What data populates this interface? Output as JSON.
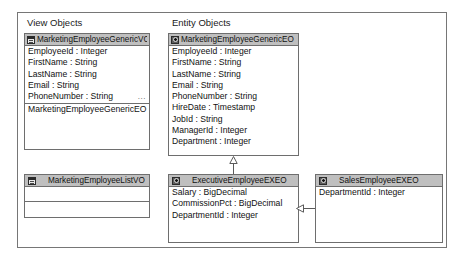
{
  "diagram": {
    "groups": [
      {
        "id": "view-objects",
        "label": "View Objects"
      },
      {
        "id": "entity-objects",
        "label": "Entity Objects"
      }
    ],
    "classes": [
      {
        "id": "marketing-employee-generic-vo",
        "name": "MarketingEmployeeGenericVO",
        "icon": "view-object-icon",
        "attributes": [
          "EmployeeId : Integer",
          "FirstName : String",
          "LastName : String",
          "Email : String",
          "PhoneNumber : String"
        ],
        "overflow_marker": "...",
        "nested": [
          "MarketingEmployeeGenericEO"
        ]
      },
      {
        "id": "marketing-employee-generic-eo",
        "name": "MarketingEmployeeGenericEO",
        "icon": "entity-object-icon",
        "attributes": [
          "EmployeeId : Integer",
          "FirstName : String",
          "LastName : String",
          "Email : String",
          "PhoneNumber : String",
          "HireDate : Timestamp",
          "JobId : String",
          "ManagerId : Integer",
          "Department : Integer"
        ]
      },
      {
        "id": "marketing-employee-list-vo",
        "name": "MarketingEmployeeListVO",
        "icon": "view-object-icon",
        "attributes": []
      },
      {
        "id": "executive-employee-exeo",
        "name": "ExecutiveEmployeeEXEO",
        "icon": "entity-object-icon",
        "attributes": [
          "Salary : BigDecimal",
          "CommissionPct : BigDecimal",
          "DepartmentId : Integer"
        ]
      },
      {
        "id": "sales-employee-exeo",
        "name": "SalesEmployeeEXEO",
        "icon": "entity-object-icon",
        "attributes": [
          "DepartmentId : Integer"
        ]
      }
    ],
    "relationships": [
      {
        "id": "exec-extends-generic",
        "type": "generalization",
        "from": "executive-employee-exeo",
        "to": "marketing-employee-generic-eo"
      },
      {
        "id": "sales-extends-exec",
        "type": "generalization",
        "from": "sales-employee-exeo",
        "to": "executive-employee-exeo"
      }
    ],
    "colors": {
      "header_fill": "#bfbfbf",
      "border": "#6e6e6e",
      "frame_border": "#767676",
      "background": "#ffffff",
      "text": "#111111",
      "connector": "#5a5a5a"
    }
  }
}
